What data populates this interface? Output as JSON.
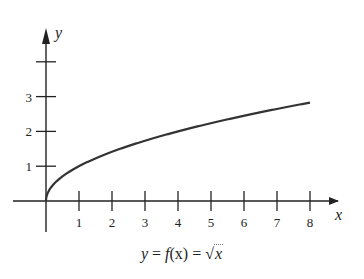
{
  "chart_data": {
    "type": "line",
    "title": "",
    "caption": "y = f(x) = √x",
    "xlabel": "x",
    "ylabel": "y",
    "x_ticks": [
      1,
      2,
      3,
      4,
      5,
      6,
      7,
      8
    ],
    "y_ticks": [
      1,
      2,
      3
    ],
    "y_extra_unlabeled_tick": 4,
    "xlim": [
      -1,
      8.8
    ],
    "ylim": [
      -1,
      4.5
    ],
    "grid": false,
    "legend": null,
    "function": "sqrt(x)",
    "series": [
      {
        "name": "y = sqrt(x)",
        "x": [
          0,
          0.25,
          0.5,
          1,
          2,
          3,
          4,
          5,
          6,
          7,
          8
        ],
        "y": [
          0,
          0.5,
          0.71,
          1,
          1.41,
          1.73,
          2,
          2.24,
          2.45,
          2.65,
          2.83
        ]
      }
    ],
    "colors": {
      "axis": "#222222",
      "curve": "#333333"
    }
  },
  "labels": {
    "x_axis": "x",
    "y_axis": "y",
    "x_ticks": [
      "1",
      "2",
      "3",
      "4",
      "5",
      "6",
      "7",
      "8"
    ],
    "y_ticks": [
      "1",
      "2",
      "3"
    ],
    "caption_y": "y",
    "caption_eq1": " = ",
    "caption_f": "f",
    "caption_arg": "(x)",
    "caption_eq2": " = ",
    "caption_rad": "√",
    "caption_x": "x"
  }
}
